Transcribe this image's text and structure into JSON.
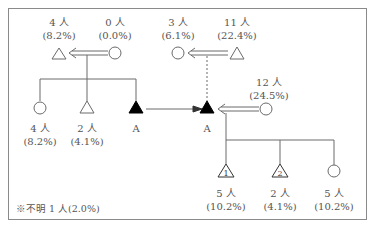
{
  "diagram": {
    "type": "family-tree-genogram",
    "colors": {
      "line": "#6a6a6a",
      "text": "#555555",
      "filled_symbol": "#000000",
      "border": "#8a8a8a"
    },
    "nodes": {
      "pgm": {
        "symbol": "triangle",
        "count": "4 人",
        "pct": "(8.2%)"
      },
      "pgf": {
        "symbol": "circle",
        "count": "0 人",
        "pct": "(0.0%)"
      },
      "mgm": {
        "symbol": "circle",
        "count": "3 人",
        "pct": "(6.1%)"
      },
      "mgf": {
        "symbol": "triangle",
        "count": "11 人",
        "pct": "(22.4%)"
      },
      "sib_circle": {
        "symbol": "circle",
        "count": "4 人",
        "pct": "(8.2%)"
      },
      "sib_triangle": {
        "symbol": "triangle",
        "count": "2 人",
        "pct": "(4.1%)"
      },
      "a_left": {
        "symbol": "filled-triangle",
        "label": "A"
      },
      "a_right": {
        "symbol": "filled-triangle",
        "label": "A"
      },
      "spouse": {
        "symbol": "circle",
        "count": "12 人",
        "pct": "(24.5%)"
      },
      "child1": {
        "symbol": "triangle-numbered",
        "number": "1",
        "count": "5 人",
        "pct": "(10.2%)"
      },
      "child2": {
        "symbol": "triangle-numbered",
        "number": "2",
        "count": "2 人",
        "pct": "(4.1%)"
      },
      "child3": {
        "symbol": "circle",
        "count": "5 人",
        "pct": "(10.2%)"
      }
    },
    "note": "※不明 1 人(2.0%)"
  }
}
